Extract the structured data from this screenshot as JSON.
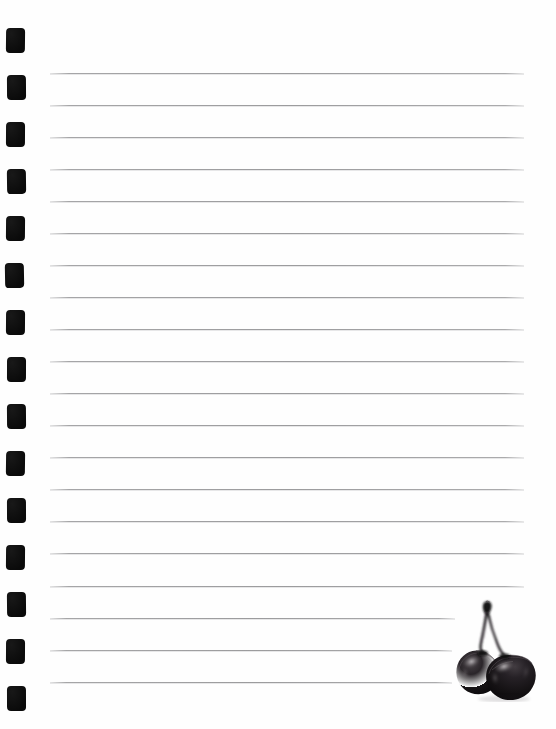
{
  "page": {
    "width": 556,
    "height": 729,
    "background_color": "#fefefe",
    "paper_type": "ruled-loose-leaf"
  },
  "binder_holes": {
    "name": "binder-hole-strip",
    "count": 15,
    "shape": "rounded-square",
    "color": "#0a0a0a",
    "left_px": 6,
    "width_px": 19,
    "height_px": 25,
    "tops": [
      28,
      75,
      122,
      169,
      216,
      263,
      310,
      357,
      404,
      451,
      498,
      545,
      592,
      639,
      686
    ]
  },
  "rules": {
    "name": "ruled-lines",
    "count": 20,
    "color": "#96969a",
    "left_px": 50,
    "default_right_px": 524,
    "spacing_px": 32,
    "lines": [
      {
        "y": 73,
        "x": 50,
        "right": 524
      },
      {
        "y": 105,
        "x": 50,
        "right": 524
      },
      {
        "y": 137,
        "x": 50,
        "right": 524
      },
      {
        "y": 169,
        "x": 50,
        "right": 524
      },
      {
        "y": 201,
        "x": 50,
        "right": 524
      },
      {
        "y": 233,
        "x": 50,
        "right": 524
      },
      {
        "y": 265,
        "x": 50,
        "right": 524
      },
      {
        "y": 297,
        "x": 50,
        "right": 524
      },
      {
        "y": 329,
        "x": 50,
        "right": 524
      },
      {
        "y": 361,
        "x": 50,
        "right": 524
      },
      {
        "y": 393,
        "x": 50,
        "right": 524
      },
      {
        "y": 425,
        "x": 50,
        "right": 524
      },
      {
        "y": 457,
        "x": 50,
        "right": 524
      },
      {
        "y": 489,
        "x": 50,
        "right": 524
      },
      {
        "y": 521,
        "x": 50,
        "right": 524
      },
      {
        "y": 553,
        "x": 50,
        "right": 524
      },
      {
        "y": 586,
        "x": 50,
        "right": 524
      },
      {
        "y": 618,
        "x": 50,
        "right": 455
      },
      {
        "y": 650,
        "x": 50,
        "right": 452
      },
      {
        "y": 682,
        "x": 50,
        "right": 452
      }
    ]
  },
  "cherries": {
    "name": "cherries-photo",
    "label": "two dark cherries joined at the stem",
    "fruit_color": "#141214",
    "stem_color": "#2a262a",
    "highlight_color": "#a9a4a6",
    "left_px": 452,
    "top_px": 598,
    "width_px": 98,
    "height_px": 104
  }
}
